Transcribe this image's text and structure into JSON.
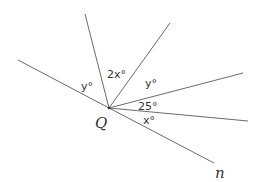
{
  "diagram": {
    "type": "angles-at-point",
    "point_label": "Q",
    "line_label": "n",
    "angle_labels": {
      "left": "y°",
      "top": "2x°",
      "upper_right": "y°",
      "right": "25°",
      "lower_right": "x°"
    },
    "colors": {
      "line": "#6b6b6b",
      "text": "#333333",
      "background": "#ffffff"
    }
  }
}
